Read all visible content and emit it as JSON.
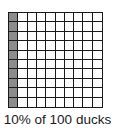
{
  "diagram": {
    "type": "hundred-grid",
    "rows": 10,
    "cols": 10,
    "shaded_columns": [
      0
    ],
    "shaded_count": 10,
    "total_cells": 100,
    "shade_color": "#8c8c8c",
    "line_color": "#1a1a1a"
  },
  "caption": "10% of 100 ducks"
}
